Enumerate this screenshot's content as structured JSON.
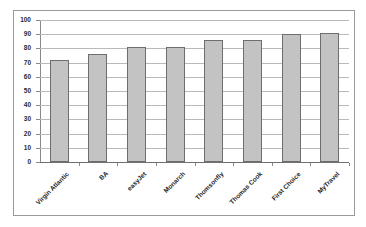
{
  "chart_data": {
    "type": "bar",
    "title": "",
    "subtitle": "",
    "xlabel": "",
    "ylabel": "",
    "categories": [
      "Virgin Atlantic",
      "BA",
      "easyJet",
      "Monarch",
      "Thomsonfly",
      "Thomas Cook",
      "First Choice",
      "MyTravel"
    ],
    "values": [
      72,
      76,
      81,
      81,
      86,
      86,
      90,
      91
    ],
    "ylim": [
      0,
      100
    ],
    "ytick_values": [
      0,
      10,
      20,
      30,
      40,
      50,
      60,
      70,
      80,
      90,
      100
    ],
    "ytick_labels": [
      "0",
      "10",
      "20",
      "30",
      "40",
      "50",
      "60",
      "70",
      "80",
      "90",
      "100"
    ],
    "grid": true,
    "grid_axis": "y",
    "legend": false,
    "legend_position": "none",
    "bar_fill_color": "#c3c3c3",
    "bar_edge_color": "#6e6e6e",
    "gridline_color": "#b9b9b9",
    "axis_color": "#8a8a8a",
    "background_color": "#ffffff",
    "frame_border_color": "#9a9a9a",
    "xtick_label_rotation": -45
  }
}
